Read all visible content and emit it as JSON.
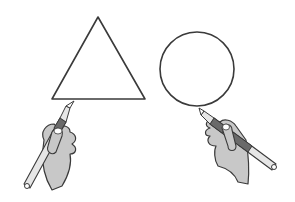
{
  "illustration": {
    "description": "Two hands drawing shapes with pens: a triangle on the left and a circle on the right",
    "left": {
      "shape": "triangle",
      "tool": "pen"
    },
    "right": {
      "shape": "circle",
      "tool": "pen"
    },
    "colors": {
      "background": "#ffffff",
      "outline": "#3a3a3a",
      "hand_fill": "#c8c8c8",
      "pen_body": "#e6e6e6",
      "pen_grip": "#6a6a6a"
    }
  }
}
